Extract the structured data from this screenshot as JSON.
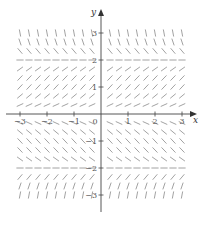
{
  "figure": {
    "type": "slope_field",
    "x_axis": {
      "label": "x",
      "range": [
        -3,
        3
      ],
      "ticks": [
        -3,
        -2,
        -1,
        0,
        1,
        2,
        3
      ],
      "tick_labels": [
        "−3",
        "−2",
        "−1",
        "0",
        "1",
        "2",
        "3"
      ]
    },
    "y_axis": {
      "label": "y",
      "range": [
        -3,
        3
      ],
      "ticks": [
        -3,
        -2,
        -1,
        1,
        2,
        3
      ],
      "tick_labels": [
        "−3",
        "−2",
        "−1",
        "1",
        "2",
        "3"
      ]
    },
    "grid_step": 0.3333,
    "equilibria_y": [
      -2,
      0,
      2
    ],
    "slope_sign_by_region": [
      {
        "y_range": "y > 2",
        "sign": "negative (steep)"
      },
      {
        "y_range": "0 < y < 2",
        "sign": "positive"
      },
      {
        "y_range": "-2 < y < 0",
        "sign": "negative"
      },
      {
        "y_range": "y < -2",
        "sign": "positive (steep)"
      }
    ],
    "colors": {
      "segments": "#8a8a8a",
      "axes": "#444444",
      "labels": "#555555",
      "background": "#ffffff"
    }
  }
}
